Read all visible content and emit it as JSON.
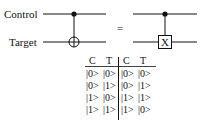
{
  "circuit": {
    "labels": {
      "control": "Control",
      "target": "Target"
    },
    "equals": "=",
    "right_gate_label": "X"
  },
  "truth_table": {
    "headers": [
      "C",
      "T",
      "C",
      "T"
    ],
    "rows": [
      [
        "|0>",
        "|0>",
        "|0>",
        "|0>"
      ],
      [
        "|0>",
        "|1>",
        "|0>",
        "|1>"
      ],
      [
        "|1>",
        "|0>",
        "|1>",
        "|1>"
      ],
      [
        "|1>",
        "|1>",
        "|1>",
        "|0>"
      ]
    ]
  }
}
